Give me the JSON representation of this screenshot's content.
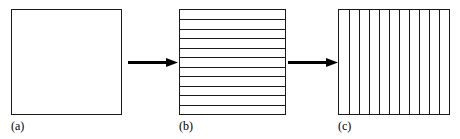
{
  "figure": {
    "background_color": "#ffffff",
    "stroke_color": "#1a1a1a",
    "width": 460,
    "height": 139
  },
  "panels": [
    {
      "id": "panel-a",
      "label": "(a)",
      "shape": "square",
      "fill": "none",
      "subdivision": "none",
      "line_count": 0,
      "line_orientation": "none",
      "box": {
        "x": 11,
        "y": 9,
        "width": 111,
        "height": 106
      },
      "label_pos": {
        "x": 11,
        "y": 120
      }
    },
    {
      "id": "panel-b",
      "label": "(b)",
      "shape": "square",
      "fill": "none",
      "subdivision": "horizontal-stripes",
      "line_count": 10,
      "line_orientation": "horizontal",
      "box": {
        "x": 179,
        "y": 9,
        "width": 107,
        "height": 106
      },
      "label_pos": {
        "x": 179,
        "y": 120
      }
    },
    {
      "id": "panel-c",
      "label": "(c)",
      "shape": "square",
      "fill": "none",
      "subdivision": "vertical-stripes",
      "line_count": 10,
      "line_orientation": "vertical",
      "box": {
        "x": 338,
        "y": 9,
        "width": 112,
        "height": 106
      },
      "label_pos": {
        "x": 338,
        "y": 120
      }
    }
  ],
  "arrows": [
    {
      "id": "arrow-a-to-b",
      "direction": "right",
      "from": "panel-a",
      "to": "panel-b",
      "pos": {
        "x": 128,
        "y": 57,
        "width": 50,
        "height": 11
      }
    },
    {
      "id": "arrow-b-to-c",
      "direction": "right",
      "from": "panel-b",
      "to": "panel-c",
      "pos": {
        "x": 288,
        "y": 57,
        "width": 50,
        "height": 11
      }
    }
  ]
}
